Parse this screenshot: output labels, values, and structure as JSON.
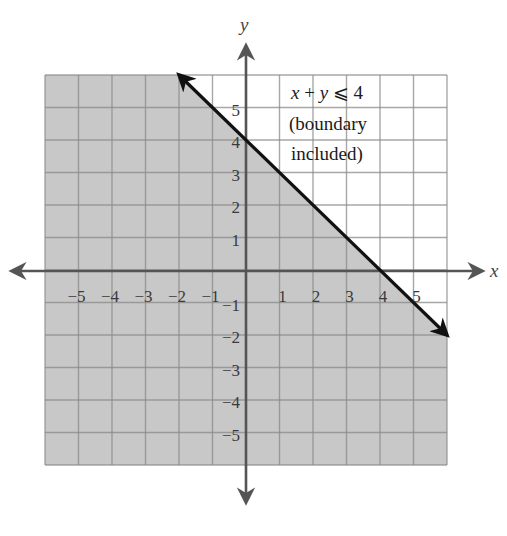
{
  "chart_data": {
    "type": "line",
    "title": "",
    "xlabel": "x",
    "ylabel": "y",
    "xlim": [
      -6,
      6
    ],
    "ylim": [
      -6,
      6
    ],
    "grid": true,
    "x_ticks": [
      -5,
      -4,
      -3,
      -2,
      -1,
      1,
      2,
      3,
      4,
      5
    ],
    "y_ticks": [
      5,
      4,
      3,
      2,
      1,
      -1,
      -2,
      -3,
      -4,
      -5
    ],
    "x_tick_labels": [
      "−5",
      "−4",
      "−3",
      "−2",
      "−1",
      "1",
      "2",
      "3",
      "4",
      "5"
    ],
    "y_tick_labels": [
      "5",
      "4",
      "3",
      "2",
      "1",
      "−1",
      "−2",
      "−3",
      "−4",
      "−5"
    ],
    "series": [
      {
        "name": "x + y = 4 (boundary)",
        "x": [
          -2,
          6
        ],
        "y": [
          6,
          -2
        ],
        "style": "solid",
        "arrows": "both",
        "color": "#111111"
      }
    ],
    "shaded_region": {
      "inequality": "x + y ≤ 4",
      "side": "below-left",
      "boundary_included": true,
      "polygon": [
        [
          -6,
          6
        ],
        [
          -2,
          6
        ],
        [
          6,
          -2
        ],
        [
          6,
          -6
        ],
        [
          -6,
          -6
        ]
      ],
      "color": "#c8c8c8"
    },
    "annotations": [
      {
        "text_italic_x": "x",
        "text_plus": " + ",
        "text_italic_y": "y",
        "text_rest": " ⩽ 4",
        "x": 1,
        "y": 5.6
      },
      {
        "text": "(boundary",
        "x": 1,
        "y": 4.6
      },
      {
        "text": "included)",
        "x": 1,
        "y": 3.6
      }
    ]
  },
  "labels": {
    "x_axis": "x",
    "y_axis": "y",
    "anno_line1_x": "x",
    "anno_line1_plus": " + ",
    "anno_line1_y": "y",
    "anno_line1_rest": " ⩽ 4",
    "anno_line2": "(boundary",
    "anno_line3": "included)"
  },
  "colors": {
    "shade": "#c8c8c8",
    "grid": "#8a8a8a",
    "grid_light": "#c4c4c4",
    "axis": "#555555",
    "boundary": "#111111"
  }
}
